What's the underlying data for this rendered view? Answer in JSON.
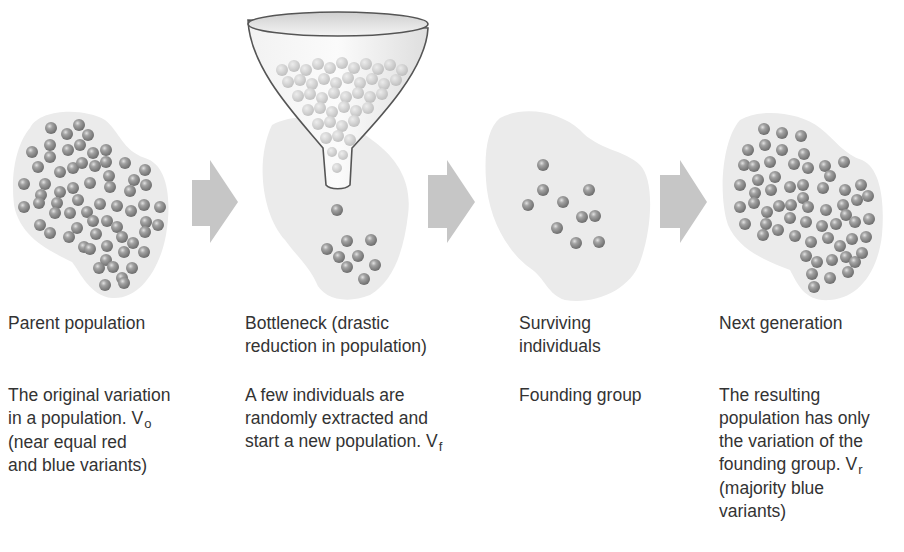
{
  "diagram": {
    "type": "process-flow",
    "topic": "Population bottleneck / founder effect",
    "colors": {
      "blob": "#ebebeb",
      "ball": "#8a8a8a",
      "ball_highlight": "#d8d8d8",
      "arrow": "#c6c6c6",
      "text": "#333333",
      "funnel_outline": "#555555"
    },
    "stages": [
      {
        "id": "parent",
        "title": "Parent population",
        "desc_lines": [
          "The original variation",
          "in a population. V"
        ],
        "desc_sub": "o",
        "desc_after": [
          "(near equal red",
          "and blue variants)"
        ],
        "ball_count": 90
      },
      {
        "id": "bottleneck",
        "title_lines": [
          "Bottleneck (drastic",
          "reduction in population)"
        ],
        "desc_lines": [
          "A few individuals are",
          "randomly extracted and",
          "start a new population. V"
        ],
        "desc_sub": "f",
        "desc_after": [],
        "ball_count": 11
      },
      {
        "id": "surviving",
        "title_lines": [
          "Surviving",
          "individuals"
        ],
        "desc_lines": [
          "Founding group"
        ],
        "desc_sub": "",
        "desc_after": [],
        "ball_count": 11
      },
      {
        "id": "next",
        "title": "Next generation",
        "desc_lines": [
          "The resulting",
          "population has only",
          "the variation of the",
          "founding group. V"
        ],
        "desc_sub": "r",
        "desc_after": [
          "(majority blue",
          "variants)"
        ],
        "ball_count": 95
      }
    ],
    "arrows": [
      {
        "from": "parent",
        "to": "bottleneck"
      },
      {
        "from": "bottleneck",
        "to": "surviving"
      },
      {
        "from": "surviving",
        "to": "next"
      }
    ]
  }
}
